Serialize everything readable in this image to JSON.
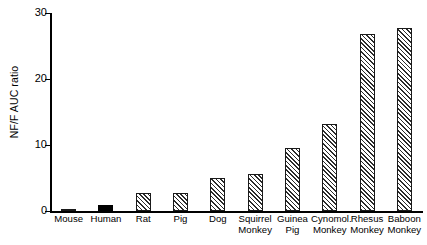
{
  "chart_data": {
    "type": "bar",
    "title": "",
    "xlabel": "",
    "ylabel": "NF/F AUC ratio",
    "ylim": [
      0,
      30
    ],
    "yticks": [
      0,
      10,
      20,
      30
    ],
    "grid": false,
    "legend": null,
    "categories": [
      "Mouse",
      "Human",
      "Rat",
      "Pig",
      "Dog",
      "Squirrel Monkey",
      "Guinea Pig",
      "Cynomol. Monkey",
      "Rhesus Monkey",
      "Baboon Monkey"
    ],
    "values": [
      0.3,
      0.9,
      2.7,
      2.7,
      5.0,
      5.6,
      9.5,
      13.2,
      26.8,
      27.8
    ],
    "bar_styles": [
      "hatched",
      "solid",
      "hatched",
      "hatched",
      "hatched",
      "hatched",
      "hatched",
      "hatched",
      "hatched",
      "hatched"
    ],
    "bars": [
      {
        "label_lines": [
          "Mouse"
        ],
        "value": 0.3,
        "style": "hatched"
      },
      {
        "label_lines": [
          "Human"
        ],
        "value": 0.9,
        "style": "solid"
      },
      {
        "label_lines": [
          "Rat"
        ],
        "value": 2.7,
        "style": "hatched"
      },
      {
        "label_lines": [
          "Pig"
        ],
        "value": 2.7,
        "style": "hatched"
      },
      {
        "label_lines": [
          "Dog"
        ],
        "value": 5.0,
        "style": "hatched"
      },
      {
        "label_lines": [
          "Squirrel",
          "Monkey"
        ],
        "value": 5.6,
        "style": "hatched"
      },
      {
        "label_lines": [
          "Guinea",
          "Pig"
        ],
        "value": 9.5,
        "style": "hatched"
      },
      {
        "label_lines": [
          "Cynomol.",
          "Monkey"
        ],
        "value": 13.2,
        "style": "hatched"
      },
      {
        "label_lines": [
          "Rhesus",
          "Monkey"
        ],
        "value": 26.8,
        "style": "hatched"
      },
      {
        "label_lines": [
          "Baboon",
          "Monkey"
        ],
        "value": 27.8,
        "style": "hatched"
      }
    ],
    "colors": {
      "axis": "#000000",
      "bar_outline": "#1a1a1a",
      "bar_hatch": "#2b2b2b",
      "bar_solid": "#000000",
      "background": "#ffffff"
    }
  }
}
